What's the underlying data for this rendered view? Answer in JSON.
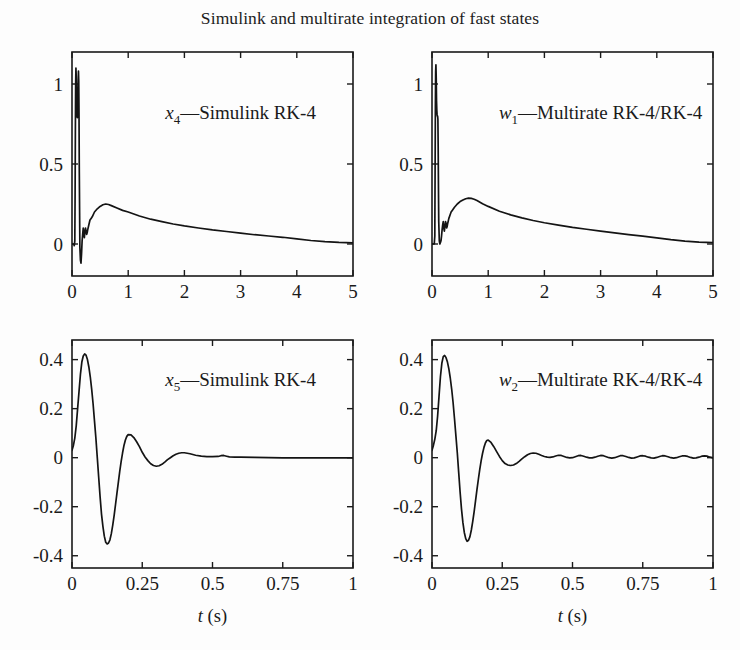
{
  "figure": {
    "title": "Simulink and multirate integration of fast states",
    "width": 740,
    "height": 650,
    "background_color": "#fdfdfd",
    "line_color": "#141414",
    "axis_color": "#1a1a1a"
  },
  "chart_data": [
    {
      "id": "panel-x4",
      "type": "line",
      "title": "",
      "annotation": "x_4—Simulink RK-4",
      "annotation_parts": {
        "symbol": "x",
        "subscript": "4",
        "rest": "—Simulink RK-4"
      },
      "xlabel": "",
      "ylabel": "",
      "xlim": [
        0,
        5
      ],
      "ylim": [
        -0.2,
        1.2
      ],
      "xticks": [
        0,
        1,
        2,
        3,
        4,
        5
      ],
      "xticklabels": [
        "0",
        "1",
        "2",
        "3",
        "4",
        "5"
      ],
      "yticks": [
        0,
        0.5,
        1
      ],
      "yticklabels": [
        "0",
        "0.5",
        "1"
      ],
      "grid": false,
      "legend": "none",
      "series": [
        {
          "name": "x4",
          "x": [
            0,
            0.01,
            0.02,
            0.03,
            0.04,
            0.05,
            0.055,
            0.06,
            0.065,
            0.07,
            0.075,
            0.08,
            0.085,
            0.09,
            0.095,
            0.1,
            0.105,
            0.11,
            0.115,
            0.12,
            0.125,
            0.13,
            0.14,
            0.15,
            0.16,
            0.17,
            0.18,
            0.19,
            0.2,
            0.21,
            0.22,
            0.23,
            0.24,
            0.25,
            0.26,
            0.27,
            0.28,
            0.3,
            0.32,
            0.34,
            0.36,
            0.4,
            0.45,
            0.5,
            0.55,
            0.6,
            0.65,
            0.7,
            0.8,
            0.9,
            1.0,
            1.2,
            1.4,
            1.6,
            1.8,
            2.0,
            2.25,
            2.5,
            2.75,
            3.0,
            3.25,
            3.5,
            3.75,
            4.0,
            4.25,
            4.5,
            4.75,
            5.0
          ],
          "y": [
            0.0,
            0.0,
            0.0,
            0.0,
            -0.01,
            0.02,
            0.3,
            0.7,
            1.0,
            1.1,
            1.05,
            0.92,
            0.84,
            0.8,
            0.79,
            0.8,
            0.9,
            1.02,
            1.08,
            1.02,
            0.8,
            0.45,
            -0.02,
            -0.1,
            -0.12,
            -0.06,
            0.02,
            0.06,
            0.1,
            0.06,
            0.04,
            0.08,
            0.1,
            0.08,
            0.06,
            0.07,
            0.09,
            0.12,
            0.15,
            0.16,
            0.17,
            0.2,
            0.22,
            0.235,
            0.245,
            0.25,
            0.247,
            0.24,
            0.225,
            0.21,
            0.2,
            0.175,
            0.155,
            0.14,
            0.125,
            0.113,
            0.1,
            0.088,
            0.078,
            0.068,
            0.058,
            0.05,
            0.042,
            0.032,
            0.022,
            0.015,
            0.01,
            0.007
          ]
        }
      ]
    },
    {
      "id": "panel-w1",
      "type": "line",
      "title": "",
      "annotation": "w_1—Multirate RK-4/RK-4",
      "annotation_parts": {
        "symbol": "w",
        "subscript": "1",
        "rest": "—Multirate RK-4/RK-4"
      },
      "xlabel": "",
      "ylabel": "",
      "xlim": [
        0,
        5
      ],
      "ylim": [
        -0.2,
        1.2
      ],
      "xticks": [
        0,
        1,
        2,
        3,
        4,
        5
      ],
      "xticklabels": [
        "0",
        "1",
        "2",
        "3",
        "4",
        "5"
      ],
      "yticks": [
        0,
        0.5,
        1
      ],
      "yticklabels": [
        "0",
        "0.5",
        "1"
      ],
      "grid": false,
      "legend": "none",
      "series": [
        {
          "name": "w1",
          "x": [
            0,
            0.01,
            0.02,
            0.03,
            0.04,
            0.05,
            0.055,
            0.06,
            0.065,
            0.07,
            0.075,
            0.08,
            0.085,
            0.09,
            0.095,
            0.1,
            0.105,
            0.11,
            0.115,
            0.12,
            0.13,
            0.14,
            0.15,
            0.16,
            0.17,
            0.18,
            0.19,
            0.2,
            0.21,
            0.22,
            0.23,
            0.24,
            0.25,
            0.26,
            0.27,
            0.28,
            0.3,
            0.32,
            0.34,
            0.36,
            0.4,
            0.45,
            0.5,
            0.55,
            0.6,
            0.65,
            0.7,
            0.75,
            0.8,
            0.9,
            1.0,
            1.2,
            1.4,
            1.6,
            1.8,
            2.0,
            2.25,
            2.5,
            2.75,
            3.0,
            3.25,
            3.5,
            3.75,
            4.0,
            4.25,
            4.5,
            4.75,
            5.0
          ],
          "y": [
            0.0,
            0.0,
            0.0,
            0.0,
            0.0,
            0.05,
            0.45,
            0.85,
            1.08,
            1.12,
            1.04,
            0.9,
            0.84,
            0.81,
            0.8,
            0.8,
            0.78,
            0.6,
            0.35,
            0.14,
            0.02,
            0.0,
            0.01,
            0.02,
            0.05,
            0.09,
            0.12,
            0.14,
            0.1,
            0.08,
            0.11,
            0.14,
            0.13,
            0.1,
            0.11,
            0.13,
            0.16,
            0.18,
            0.2,
            0.21,
            0.23,
            0.25,
            0.265,
            0.275,
            0.283,
            0.287,
            0.285,
            0.28,
            0.272,
            0.252,
            0.235,
            0.205,
            0.182,
            0.163,
            0.147,
            0.133,
            0.118,
            0.104,
            0.092,
            0.08,
            0.069,
            0.059,
            0.049,
            0.038,
            0.027,
            0.018,
            0.012,
            0.008
          ]
        }
      ]
    },
    {
      "id": "panel-x5",
      "type": "line",
      "title": "",
      "annotation": "x_5—Simulink RK-4",
      "annotation_parts": {
        "symbol": "x",
        "subscript": "5",
        "rest": "—Simulink RK-4"
      },
      "xlabel": "t (s)",
      "xlabel_parts": {
        "symbol": "t",
        "rest": " (s)"
      },
      "ylabel": "",
      "xlim": [
        0,
        1
      ],
      "ylim": [
        -0.45,
        0.48
      ],
      "xticks": [
        0,
        0.25,
        0.5,
        0.75,
        1
      ],
      "xticklabels": [
        "0",
        "0.25",
        "0.5",
        "0.75",
        "1"
      ],
      "yticks": [
        -0.4,
        -0.2,
        0,
        0.2,
        0.4
      ],
      "yticklabels": [
        "-0.4",
        "-0.2",
        "0",
        "0.2",
        "0.4"
      ],
      "grid": false,
      "legend": "none",
      "series": [
        {
          "name": "x5",
          "x": [
            0,
            0.005,
            0.01,
            0.015,
            0.02,
            0.025,
            0.03,
            0.035,
            0.04,
            0.045,
            0.05,
            0.055,
            0.06,
            0.065,
            0.07,
            0.075,
            0.08,
            0.085,
            0.09,
            0.095,
            0.1,
            0.105,
            0.11,
            0.115,
            0.12,
            0.125,
            0.13,
            0.135,
            0.14,
            0.145,
            0.15,
            0.155,
            0.16,
            0.165,
            0.17,
            0.175,
            0.18,
            0.185,
            0.19,
            0.195,
            0.2,
            0.21,
            0.22,
            0.23,
            0.24,
            0.25,
            0.26,
            0.27,
            0.28,
            0.29,
            0.3,
            0.31,
            0.32,
            0.33,
            0.34,
            0.35,
            0.36,
            0.37,
            0.38,
            0.39,
            0.4,
            0.42,
            0.44,
            0.46,
            0.48,
            0.5,
            0.52,
            0.53,
            0.54,
            0.55,
            0.56,
            0.58,
            0.6,
            0.65,
            0.7,
            0.75,
            0.8,
            0.85,
            0.9,
            0.95,
            1.0
          ],
          "y": [
            0.03,
            0.05,
            0.08,
            0.13,
            0.2,
            0.27,
            0.34,
            0.39,
            0.415,
            0.423,
            0.418,
            0.4,
            0.37,
            0.33,
            0.28,
            0.22,
            0.15,
            0.08,
            0.0,
            -0.08,
            -0.16,
            -0.23,
            -0.28,
            -0.32,
            -0.345,
            -0.352,
            -0.348,
            -0.335,
            -0.31,
            -0.275,
            -0.235,
            -0.19,
            -0.145,
            -0.1,
            -0.055,
            -0.015,
            0.02,
            0.05,
            0.072,
            0.087,
            0.094,
            0.093,
            0.082,
            0.065,
            0.045,
            0.022,
            0.003,
            -0.012,
            -0.025,
            -0.032,
            -0.035,
            -0.033,
            -0.027,
            -0.018,
            -0.008,
            0.0,
            0.008,
            0.014,
            0.018,
            0.02,
            0.02,
            0.016,
            0.01,
            0.006,
            0.004,
            0.004,
            0.005,
            0.008,
            0.009,
            0.006,
            0.003,
            0.002,
            0.002,
            0.001,
            0.0,
            -0.001,
            -0.001,
            -0.001,
            -0.001,
            -0.001,
            -0.001
          ]
        }
      ]
    },
    {
      "id": "panel-w2",
      "type": "line",
      "title": "",
      "annotation": "w_2—Multirate RK-4/RK-4",
      "annotation_parts": {
        "symbol": "w",
        "subscript": "2",
        "rest": "—Multirate RK-4/RK-4"
      },
      "xlabel": "t (s)",
      "xlabel_parts": {
        "symbol": "t",
        "rest": " (s)"
      },
      "ylabel": "",
      "xlim": [
        0,
        1
      ],
      "ylim": [
        -0.45,
        0.48
      ],
      "xticks": [
        0,
        0.25,
        0.5,
        0.75,
        1
      ],
      "xticklabels": [
        "0",
        "0.25",
        "0.5",
        "0.75",
        "1"
      ],
      "yticks": [
        -0.4,
        -0.2,
        0,
        0.2,
        0.4
      ],
      "yticklabels": [
        "-0.4",
        "-0.2",
        "0",
        "0.2",
        "0.4"
      ],
      "grid": false,
      "legend": "none",
      "series": [
        {
          "name": "w2",
          "x": [
            0,
            0.005,
            0.01,
            0.015,
            0.02,
            0.025,
            0.03,
            0.035,
            0.04,
            0.045,
            0.05,
            0.055,
            0.06,
            0.065,
            0.07,
            0.075,
            0.08,
            0.085,
            0.09,
            0.095,
            0.1,
            0.105,
            0.11,
            0.115,
            0.12,
            0.125,
            0.13,
            0.135,
            0.14,
            0.145,
            0.15,
            0.155,
            0.16,
            0.165,
            0.17,
            0.175,
            0.18,
            0.185,
            0.19,
            0.195,
            0.2,
            0.21,
            0.22,
            0.23,
            0.24,
            0.25,
            0.26,
            0.27,
            0.28,
            0.29,
            0.3,
            0.31,
            0.32,
            0.33,
            0.34,
            0.35,
            0.36,
            0.37,
            0.38,
            0.39,
            0.4,
            0.41,
            0.42,
            0.43,
            0.44,
            0.45,
            0.46,
            0.47,
            0.48,
            0.49,
            0.5,
            0.51,
            0.52,
            0.53,
            0.54,
            0.55,
            0.56,
            0.57,
            0.58,
            0.59,
            0.6,
            0.61,
            0.62,
            0.63,
            0.64,
            0.65,
            0.66,
            0.67,
            0.68,
            0.69,
            0.7,
            0.71,
            0.72,
            0.73,
            0.74,
            0.75,
            0.76,
            0.77,
            0.78,
            0.79,
            0.8,
            0.81,
            0.82,
            0.83,
            0.84,
            0.85,
            0.86,
            0.87,
            0.88,
            0.89,
            0.9,
            0.91,
            0.92,
            0.93,
            0.94,
            0.95,
            0.96,
            0.97,
            0.98,
            0.99,
            1.0
          ],
          "y": [
            0.03,
            0.05,
            0.075,
            0.11,
            0.17,
            0.25,
            0.33,
            0.385,
            0.412,
            0.417,
            0.408,
            0.39,
            0.362,
            0.325,
            0.28,
            0.225,
            0.16,
            0.09,
            0.02,
            -0.06,
            -0.14,
            -0.21,
            -0.265,
            -0.305,
            -0.33,
            -0.341,
            -0.337,
            -0.322,
            -0.295,
            -0.26,
            -0.22,
            -0.175,
            -0.13,
            -0.088,
            -0.048,
            -0.012,
            0.018,
            0.042,
            0.06,
            0.07,
            0.072,
            0.062,
            0.045,
            0.025,
            0.005,
            -0.012,
            -0.024,
            -0.03,
            -0.032,
            -0.03,
            -0.024,
            -0.015,
            -0.005,
            0.004,
            0.012,
            0.017,
            0.019,
            0.018,
            0.014,
            0.009,
            0.005,
            0.002,
            0.001,
            0.003,
            0.007,
            0.01,
            0.009,
            0.005,
            0.001,
            -0.001,
            0.0,
            0.004,
            0.008,
            0.009,
            0.006,
            0.002,
            -0.001,
            -0.001,
            0.002,
            0.006,
            0.009,
            0.008,
            0.004,
            0.0,
            -0.002,
            0.0,
            0.004,
            0.008,
            0.008,
            0.005,
            0.001,
            -0.002,
            -0.001,
            0.003,
            0.007,
            0.008,
            0.006,
            0.002,
            -0.001,
            -0.002,
            0.001,
            0.005,
            0.008,
            0.007,
            0.004,
            0.0,
            -0.002,
            0.0,
            0.004,
            0.007,
            0.007,
            0.005,
            0.001,
            -0.002,
            -0.001,
            0.002,
            0.006,
            0.007,
            0.006,
            0.002,
            -0.001,
            -0.002
          ]
        }
      ]
    }
  ]
}
